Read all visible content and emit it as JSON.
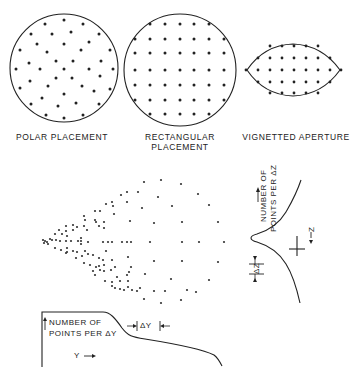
{
  "figure": {
    "panels": [
      {
        "id": "polar",
        "label": "POLAR PLACEMENT"
      },
      {
        "id": "rectangular",
        "label_line1": "RECTANGULAR",
        "label_line2": "PLACEMENT"
      },
      {
        "id": "vignetted",
        "label": "VIGNETTED APERTURE"
      }
    ],
    "spot_diagram": {
      "description": "ray intercept spot pattern, dense at left apex, spreading right"
    },
    "z_plot": {
      "label_line1": "NUMBER OF",
      "label_line2": "POINTS PER ΔZ",
      "axis_label": "Z",
      "interval_label": "ΔZ"
    },
    "y_plot": {
      "label_line1": "NUMBER OF",
      "label_line2": "POINTS PER ΔY",
      "axis_label": "Y",
      "interval_label": "ΔY"
    }
  }
}
